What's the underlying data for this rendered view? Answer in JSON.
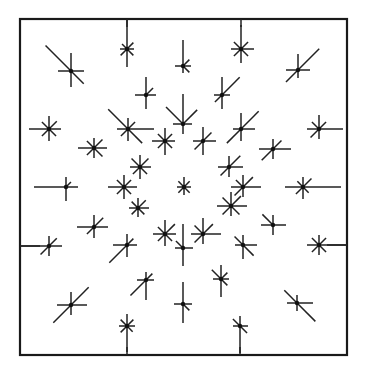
{
  "diagram": {
    "type": "star-glyph-field",
    "frame": {
      "x": 20,
      "y": 19,
      "width": 327,
      "height": 336
    },
    "colors": {
      "ink": "#222222",
      "background": "#ffffff"
    },
    "spoke_order": [
      "N",
      "NE",
      "E",
      "SE",
      "S",
      "SW",
      "W",
      "NW"
    ],
    "edge_ticks": [
      {
        "side": "top",
        "x": 127,
        "len": 8
      },
      {
        "side": "top",
        "x": 241,
        "len": 8
      },
      {
        "side": "bottom",
        "x": 127,
        "len": 8
      },
      {
        "side": "bottom",
        "x": 240,
        "len": 8
      },
      {
        "side": "left",
        "y": 246,
        "len": 20
      },
      {
        "side": "right",
        "y": 245,
        "len": 20
      }
    ],
    "glyphs": [
      {
        "x": 71,
        "y": 71,
        "r": [
          18,
          0,
          13,
          18,
          16,
          0,
          13,
          36
        ]
      },
      {
        "x": 127,
        "y": 49,
        "r": [
          30,
          9,
          7,
          9,
          18,
          9,
          7,
          7
        ]
      },
      {
        "x": 183,
        "y": 66,
        "r": [
          26,
          9,
          8,
          9,
          7,
          0,
          8,
          0
        ]
      },
      {
        "x": 241,
        "y": 49,
        "r": [
          24,
          10,
          13,
          10,
          14,
          10,
          10,
          10
        ]
      },
      {
        "x": 298,
        "y": 70,
        "r": [
          16,
          30,
          12,
          0,
          8,
          17,
          12,
          0
        ]
      },
      {
        "x": 146,
        "y": 95,
        "r": [
          18,
          10,
          10,
          0,
          14,
          0,
          11,
          0
        ]
      },
      {
        "x": 222,
        "y": 95,
        "r": [
          18,
          25,
          8,
          0,
          14,
          10,
          8,
          0
        ]
      },
      {
        "x": 49,
        "y": 129,
        "r": [
          13,
          11,
          12,
          10,
          12,
          10,
          20,
          10
        ]
      },
      {
        "x": 128,
        "y": 129,
        "r": [
          11,
          10,
          26,
          20,
          12,
          10,
          11,
          28
        ]
      },
      {
        "x": 183,
        "y": 124,
        "r": [
          30,
          20,
          9,
          0,
          10,
          0,
          10,
          24
        ]
      },
      {
        "x": 241,
        "y": 129,
        "r": [
          16,
          25,
          14,
          0,
          12,
          20,
          8,
          0
        ]
      },
      {
        "x": 319,
        "y": 129,
        "r": [
          14,
          10,
          24,
          0,
          10,
          12,
          12,
          10
        ]
      },
      {
        "x": 94,
        "y": 148,
        "r": [
          10,
          12,
          13,
          12,
          10,
          10,
          16,
          10
        ]
      },
      {
        "x": 165,
        "y": 141,
        "r": [
          13,
          10,
          10,
          10,
          14,
          10,
          13,
          10
        ]
      },
      {
        "x": 203,
        "y": 141,
        "r": [
          14,
          12,
          13,
          0,
          14,
          12,
          10,
          0
        ]
      },
      {
        "x": 273,
        "y": 149,
        "r": [
          10,
          12,
          18,
          0,
          10,
          16,
          14,
          0
        ]
      },
      {
        "x": 140,
        "y": 167,
        "r": [
          12,
          12,
          11,
          10,
          12,
          10,
          10,
          12
        ]
      },
      {
        "x": 229,
        "y": 167,
        "r": [
          11,
          16,
          14,
          0,
          10,
          12,
          11,
          0
        ]
      },
      {
        "x": 66,
        "y": 187,
        "r": [
          10,
          7,
          12,
          0,
          14,
          0,
          32,
          0
        ]
      },
      {
        "x": 124,
        "y": 187,
        "r": [
          12,
          10,
          13,
          10,
          12,
          10,
          16,
          10
        ]
      },
      {
        "x": 184,
        "y": 187,
        "r": [
          10,
          8,
          7,
          8,
          8,
          8,
          7,
          8
        ]
      },
      {
        "x": 243,
        "y": 187,
        "r": [
          12,
          14,
          18,
          0,
          10,
          12,
          12,
          10
        ]
      },
      {
        "x": 303,
        "y": 187,
        "r": [
          10,
          12,
          38,
          8,
          12,
          10,
          18,
          8
        ]
      },
      {
        "x": 138,
        "y": 208,
        "r": [
          10,
          11,
          11,
          9,
          9,
          9,
          9,
          9
        ]
      },
      {
        "x": 231,
        "y": 206,
        "r": [
          14,
          14,
          16,
          12,
          10,
          12,
          14,
          12
        ]
      },
      {
        "x": 94,
        "y": 227,
        "r": [
          12,
          13,
          14,
          0,
          11,
          10,
          17,
          0
        ]
      },
      {
        "x": 165,
        "y": 234,
        "r": [
          14,
          14,
          11,
          10,
          12,
          10,
          12,
          10
        ]
      },
      {
        "x": 203,
        "y": 234,
        "r": [
          16,
          14,
          18,
          0,
          10,
          12,
          12,
          12
        ]
      },
      {
        "x": 273,
        "y": 225,
        "r": [
          10,
          0,
          13,
          0,
          10,
          0,
          12,
          15
        ]
      },
      {
        "x": 49,
        "y": 246,
        "r": [
          10,
          11,
          13,
          0,
          10,
          12,
          29,
          0
        ]
      },
      {
        "x": 127,
        "y": 245,
        "r": [
          11,
          9,
          10,
          0,
          12,
          25,
          14,
          0
        ]
      },
      {
        "x": 183,
        "y": 248,
        "r": [
          24,
          0,
          10,
          0,
          18,
          0,
          8,
          10
        ]
      },
      {
        "x": 243,
        "y": 245,
        "r": [
          10,
          0,
          14,
          15,
          14,
          0,
          8,
          12
        ]
      },
      {
        "x": 319,
        "y": 245,
        "r": [
          10,
          10,
          28,
          10,
          10,
          10,
          12,
          10
        ]
      },
      {
        "x": 146,
        "y": 280,
        "r": [
          8,
          9,
          8,
          0,
          20,
          22,
          9,
          0
        ]
      },
      {
        "x": 221,
        "y": 279,
        "r": [
          14,
          9,
          8,
          9,
          18,
          0,
          8,
          13
        ]
      },
      {
        "x": 71,
        "y": 305,
        "r": [
          13,
          25,
          16,
          0,
          10,
          25,
          14,
          0
        ]
      },
      {
        "x": 127,
        "y": 326,
        "r": [
          12,
          9,
          8,
          8,
          26,
          9,
          8,
          9
        ]
      },
      {
        "x": 183,
        "y": 304,
        "r": [
          22,
          0,
          9,
          9,
          19,
          0,
          9,
          0
        ]
      },
      {
        "x": 240,
        "y": 326,
        "r": [
          10,
          0,
          8,
          10,
          27,
          0,
          7,
          10
        ]
      },
      {
        "x": 297,
        "y": 303,
        "r": [
          8,
          0,
          16,
          26,
          8,
          0,
          10,
          18
        ]
      }
    ]
  }
}
